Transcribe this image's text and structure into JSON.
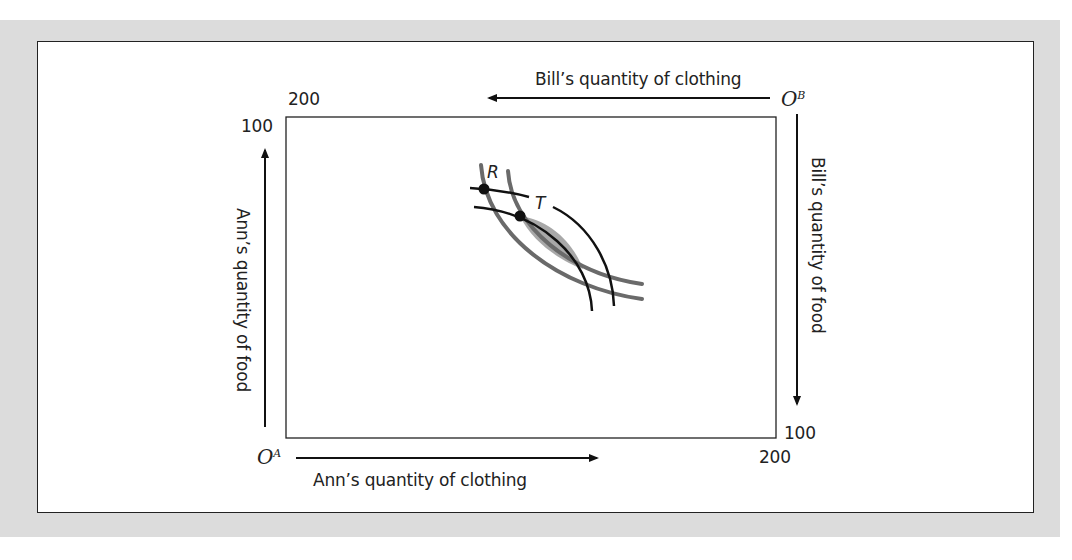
{
  "diagram": {
    "type": "edgeworth-box",
    "colors": {
      "background": "#dcdcdc",
      "panel": "#ffffff",
      "box_stroke": "#222222",
      "indifference_ann": "#6a6a6a",
      "indifference_bill": "#111111",
      "lens_fill": "#a8a8a8"
    },
    "origins": {
      "ann": {
        "base": "O",
        "sup": "A"
      },
      "bill": {
        "base": "O",
        "sup": "B"
      }
    },
    "axis_labels": {
      "ann_clothing": "Ann’s quantity of clothing",
      "ann_food": "Ann’s quantity of food",
      "bill_clothing": "Bill’s quantity of clothing",
      "bill_food": "Bill’s quantity of food"
    },
    "tick_labels": {
      "top_left_clothing": "200",
      "top_left_food": "100",
      "bottom_right_food": "100",
      "bottom_right_clothing": "200"
    },
    "points": [
      {
        "label": "R"
      },
      {
        "label": "T"
      }
    ],
    "totals": {
      "clothing": 200,
      "food": 100
    }
  }
}
